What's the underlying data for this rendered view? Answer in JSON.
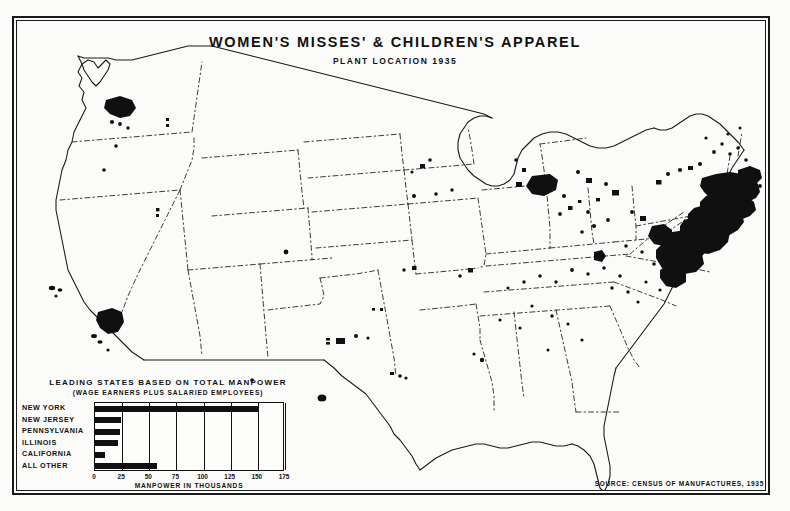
{
  "header": {
    "title": "WOMEN'S MISSES' & CHILDREN'S APPAREL",
    "subtitle": "PLANT LOCATION 1935"
  },
  "source": {
    "text": "SOURCE: CENSUS OF MANUFACTURES, 1935"
  },
  "legend": {
    "heading": "LEADING STATES BASED ON TOTAL MANPOWER",
    "subheading": "(WAGE EARNERS PLUS SALARIED EMPLOYEES)",
    "axis_title": "MANPOWER IN THOUSANDS"
  },
  "chart_data": {
    "type": "bar",
    "orientation": "horizontal",
    "title": "LEADING STATES BASED ON TOTAL MANPOWER",
    "subtitle": "(WAGE EARNERS PLUS SALARIED EMPLOYEES)",
    "xlabel": "MANPOWER IN THOUSANDS",
    "ylabel": "",
    "xlim": [
      0,
      175
    ],
    "ticks": [
      0,
      25,
      50,
      75,
      100,
      125,
      150,
      175
    ],
    "tick_labels": [
      "0",
      "25",
      "50",
      "75",
      "100",
      "125",
      "150",
      "175"
    ],
    "grid": true,
    "legend": "none",
    "categories": [
      "NEW YORK",
      "NEW JERSEY",
      "PENNSYLVANIA",
      "ILLINOIS",
      "CALIFORNIA",
      "ALL OTHER"
    ],
    "values": [
      150,
      24,
      23,
      21,
      9,
      57
    ],
    "bar_color": "#111111"
  },
  "map": {
    "name": "united-states-plant-location-map",
    "description": "Outline map of the contiguous United States with state boundaries, plant locations shown as black dots and filled blobs"
  }
}
